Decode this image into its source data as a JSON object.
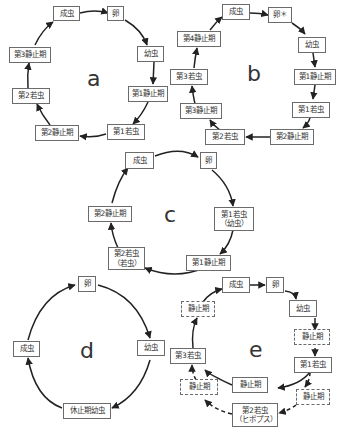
{
  "diagrams": {
    "a": {
      "label": "a",
      "nodes": [
        "成虫",
        "卵",
        "幼虫",
        "第1静止期",
        "第1若虫",
        "第2静止期",
        "第2若虫",
        "第3静止期"
      ]
    },
    "b": {
      "label": "b",
      "nodes": [
        "成虫",
        "卵＊",
        "幼虫",
        "第1静止期",
        "第1若虫",
        "第2静止期",
        "第2若虫",
        "第3静止期",
        "第3若虫",
        "第4静止期"
      ]
    },
    "c": {
      "label": "c",
      "nodes": [
        "成虫",
        "卵",
        "第1若虫\n（幼虫）",
        "第1静止期",
        "第2若虫\n（若虫）",
        "第2静止期"
      ]
    },
    "d": {
      "label": "d",
      "nodes": [
        "卵",
        "幼虫",
        "休止期幼虫",
        "成虫"
      ]
    },
    "e": {
      "label": "e",
      "nodes": [
        "成虫",
        "卵",
        "幼虫",
        "静止期",
        "第1若虫",
        "静止期",
        "静止期",
        "第2若虫\n（ヒポプス）",
        "静止期",
        "第3若虫",
        "静止期"
      ]
    }
  },
  "colors": {
    "line": "#222222",
    "box_border": "#6b6b6b",
    "text": "#333333"
  }
}
